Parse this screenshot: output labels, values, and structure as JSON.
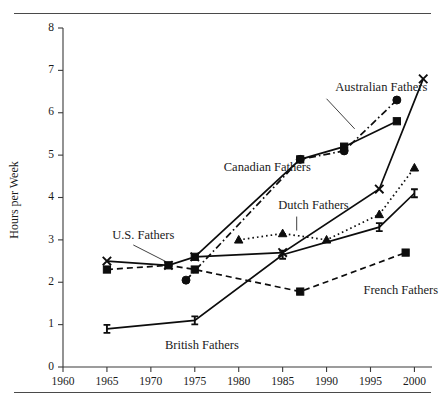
{
  "figure": {
    "top_rule": "",
    "bottom_rule": ""
  },
  "chart_data": {
    "type": "line",
    "title": "",
    "xlabel": "",
    "ylabel": "Hours per Week",
    "xlim": [
      1960,
      2002
    ],
    "ylim": [
      0,
      8
    ],
    "grid": false,
    "legend_position": "inline-annotations",
    "xticks": [
      1960,
      1965,
      1970,
      1975,
      1980,
      1985,
      1990,
      1995,
      2000
    ],
    "xtick_labels": [
      "1960",
      "1965",
      "1970",
      "1975",
      "1980",
      "1985",
      "1990",
      "1995",
      "2000"
    ],
    "yticks": [
      0,
      1,
      2,
      3,
      4,
      5,
      6,
      7,
      8
    ],
    "ytick_labels": [
      "0",
      "1",
      "2",
      "3",
      "4",
      "5",
      "6",
      "7",
      "8"
    ],
    "series": [
      {
        "name": "Canadian Fathers",
        "label": "Canadian Fathers",
        "marker": "square",
        "linestyle": "solid",
        "color": "#0d0d0d",
        "x": [
          1975,
          1987,
          1992,
          1998
        ],
        "values": [
          2.6,
          4.9,
          5.2,
          5.8
        ]
      },
      {
        "name": "Australian Fathers",
        "label": "Australian Fathers",
        "marker": "circle",
        "linestyle": "dashdot",
        "color": "#0d0d0d",
        "x": [
          1974,
          1987,
          1992,
          1998
        ],
        "values": [
          2.05,
          4.9,
          5.1,
          6.3
        ]
      },
      {
        "name": "U.S. Fathers",
        "label": "U.S. Fathers",
        "marker": "cross",
        "linestyle": "solid",
        "color": "#0d0d0d",
        "x": [
          1965,
          1972,
          1975,
          1985,
          1996,
          2001
        ],
        "values": [
          2.5,
          2.4,
          2.6,
          2.7,
          4.2,
          6.8
        ]
      },
      {
        "name": "Dutch Fathers",
        "label": "Dutch Fathers",
        "marker": "triangle",
        "linestyle": "dotted",
        "color": "#0d0d0d",
        "x": [
          1980,
          1985,
          1990,
          1996,
          2000
        ],
        "values": [
          3.0,
          3.15,
          3.0,
          3.6,
          4.7
        ]
      },
      {
        "name": "British Fathers",
        "label": "British Fathers",
        "marker": "ibar",
        "linestyle": "solid",
        "color": "#0d0d0d",
        "x": [
          1965,
          1975,
          1985,
          1996,
          2000
        ],
        "values": [
          0.9,
          1.1,
          2.65,
          3.3,
          4.1
        ]
      },
      {
        "name": "French Fathers",
        "label": "French Fathers",
        "marker": "square",
        "linestyle": "dashed",
        "color": "#0d0d0d",
        "x": [
          1965,
          1972,
          1975,
          1987,
          1999
        ],
        "values": [
          2.3,
          2.4,
          2.3,
          1.78,
          2.7
        ]
      }
    ],
    "annotations": [
      {
        "text": "Canadian Fathers",
        "x": 1978.3,
        "y": 4.62
      },
      {
        "text": "Australian Fathers",
        "x": 1991.0,
        "y": 6.52
      },
      {
        "text": "Dutch Fathers",
        "x": 1984.5,
        "y": 3.72
      },
      {
        "text": "U.S. Fathers",
        "x": 1965.6,
        "y": 3.02
      },
      {
        "text": "British Fathers",
        "x": 1971.6,
        "y": 0.42
      },
      {
        "text": "French Fathers",
        "x": 1994.2,
        "y": 1.72
      }
    ]
  }
}
